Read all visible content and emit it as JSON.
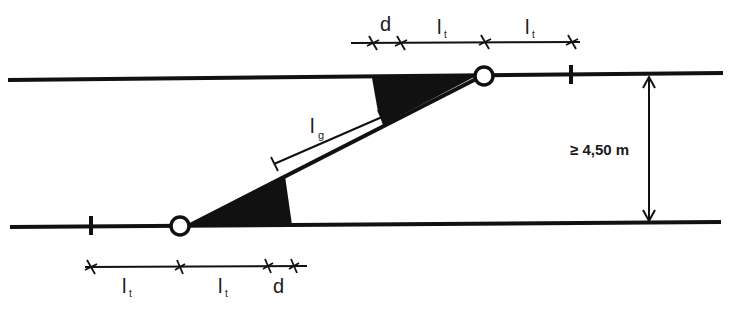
{
  "diagram": {
    "type": "lane-shift / track offset schematic",
    "colors": {
      "ink": "#111111",
      "background": "#ffffff"
    },
    "top_dimension": {
      "labels": [
        {
          "base": "d",
          "sub": ""
        },
        {
          "base": "l",
          "sub": "t"
        },
        {
          "base": "l",
          "sub": "t"
        }
      ]
    },
    "bottom_dimension": {
      "labels": [
        {
          "base": "l",
          "sub": "t"
        },
        {
          "base": "l",
          "sub": "t"
        },
        {
          "base": "d",
          "sub": ""
        }
      ]
    },
    "diagonal_dimension": {
      "base": "l",
      "sub": "g"
    },
    "vertical_dimension": {
      "label": "≥ 4,50 m"
    }
  }
}
